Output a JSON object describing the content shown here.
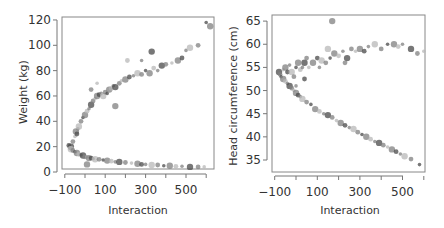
{
  "chart_data": [
    {
      "type": "scatter",
      "title": "",
      "xlabel": "Interaction",
      "ylabel": "Weight (kg)",
      "xlim": [
        -110,
        630
      ],
      "ylim": [
        0,
        120
      ],
      "x_ticks": [
        "-100",
        "100",
        "300",
        "500"
      ],
      "x_minor_ticks": [
        -100,
        0,
        100,
        200,
        300,
        400,
        500,
        600
      ],
      "y_ticks": [
        "0",
        "20",
        "40",
        "60",
        "80",
        "100",
        "120"
      ],
      "grid": false,
      "legend": null,
      "description": "Two branches: upper branch rising from ~(−60,20) to ~(600,118); lower branch decaying from ~(−80,20) to ~(580,4). Points in varying grey shades and sizes.",
      "series": [
        {
          "name": "upper-branch",
          "points": [
            [
              -70,
              20
            ],
            [
              -60,
              24
            ],
            [
              -50,
              28
            ],
            [
              -45,
              32
            ],
            [
              -40,
              30
            ],
            [
              -35,
              34
            ],
            [
              -30,
              36
            ],
            [
              -20,
              40
            ],
            [
              -10,
              43
            ],
            [
              0,
              45
            ],
            [
              10,
              48
            ],
            [
              20,
              50
            ],
            [
              30,
              53
            ],
            [
              40,
              56
            ],
            [
              50,
              58
            ],
            [
              60,
              60
            ],
            [
              70,
              61
            ],
            [
              80,
              62
            ],
            [
              90,
              60
            ],
            [
              100,
              63
            ],
            [
              110,
              62
            ],
            [
              120,
              65
            ],
            [
              130,
              66
            ],
            [
              140,
              68
            ],
            [
              150,
              67
            ],
            [
              170,
              70
            ],
            [
              180,
              72
            ],
            [
              200,
              73
            ],
            [
              220,
              75
            ],
            [
              240,
              76
            ],
            [
              260,
              78
            ],
            [
              280,
              77
            ],
            [
              300,
              80
            ],
            [
              320,
              78
            ],
            [
              340,
              82
            ],
            [
              360,
              80
            ],
            [
              380,
              84
            ],
            [
              400,
              85
            ],
            [
              430,
              86
            ],
            [
              460,
              88
            ],
            [
              480,
              90
            ],
            [
              500,
              96
            ],
            [
              520,
              98
            ],
            [
              560,
              100
            ],
            [
              600,
              118
            ],
            [
              620,
              115
            ],
            [
              210,
              88
            ],
            [
              280,
              88
            ],
            [
              330,
              95
            ],
            [
              30,
              65
            ],
            [
              60,
              70
            ],
            [
              150,
              52
            ]
          ]
        },
        {
          "name": "lower-branch",
          "points": [
            [
              -80,
              21
            ],
            [
              -75,
              19
            ],
            [
              -70,
              18
            ],
            [
              -60,
              17
            ],
            [
              -50,
              16
            ],
            [
              -40,
              15
            ],
            [
              -30,
              14
            ],
            [
              -20,
              13.5
            ],
            [
              -10,
              13
            ],
            [
              0,
              12
            ],
            [
              10,
              12
            ],
            [
              20,
              11
            ],
            [
              30,
              11
            ],
            [
              40,
              10.5
            ],
            [
              50,
              10
            ],
            [
              70,
              10
            ],
            [
              90,
              9.5
            ],
            [
              110,
              9
            ],
            [
              130,
              8.5
            ],
            [
              150,
              8
            ],
            [
              170,
              8
            ],
            [
              200,
              7.5
            ],
            [
              230,
              7
            ],
            [
              260,
              6.5
            ],
            [
              280,
              6
            ],
            [
              300,
              6
            ],
            [
              330,
              5.5
            ],
            [
              360,
              5.5
            ],
            [
              390,
              5
            ],
            [
              420,
              5
            ],
            [
              450,
              4.5
            ],
            [
              480,
              4.5
            ],
            [
              520,
              4
            ],
            [
              560,
              4
            ],
            [
              590,
              4
            ],
            [
              10,
              6
            ]
          ]
        }
      ]
    },
    {
      "type": "scatter",
      "title": "",
      "xlabel": "Interaction",
      "ylabel": "Head circumference (cm)",
      "xlim": [
        -110,
        630
      ],
      "ylim": [
        33,
        66
      ],
      "x_ticks": [
        "-100",
        "100",
        "300",
        "500"
      ],
      "x_minor_ticks": [
        -100,
        0,
        100,
        200,
        300,
        400,
        500,
        600
      ],
      "y_ticks": [
        "35",
        "40",
        "45",
        "50",
        "55",
        "60",
        "65"
      ],
      "grid": false,
      "legend": null,
      "description": "Two branches: upper branch rising from ~(−80,54) to ~(600,59); lower branch falling linearly from ~(−70,53) to ~(590,34). One outlier near (170,65).",
      "series": [
        {
          "name": "upper-branch",
          "points": [
            [
              -80,
              54
            ],
            [
              -75,
              53.5
            ],
            [
              -60,
              54.5
            ],
            [
              -50,
              55
            ],
            [
              -40,
              54
            ],
            [
              -30,
              55.5
            ],
            [
              -20,
              54
            ],
            [
              -10,
              53
            ],
            [
              0,
              55
            ],
            [
              10,
              56
            ],
            [
              20,
              54.5
            ],
            [
              30,
              55
            ],
            [
              40,
              56
            ],
            [
              50,
              57
            ],
            [
              60,
              55
            ],
            [
              80,
              56
            ],
            [
              100,
              57
            ],
            [
              110,
              55
            ],
            [
              120,
              56.5
            ],
            [
              140,
              56
            ],
            [
              160,
              57
            ],
            [
              180,
              58
            ],
            [
              200,
              57.5
            ],
            [
              220,
              58.5
            ],
            [
              240,
              57
            ],
            [
              260,
              59
            ],
            [
              280,
              58.5
            ],
            [
              300,
              59
            ],
            [
              320,
              58.5
            ],
            [
              340,
              59.5
            ],
            [
              370,
              60
            ],
            [
              400,
              59
            ],
            [
              430,
              60
            ],
            [
              460,
              60
            ],
            [
              480,
              59.5
            ],
            [
              500,
              60
            ],
            [
              540,
              59
            ],
            [
              570,
              58
            ],
            [
              600,
              58.5
            ],
            [
              170,
              65
            ],
            [
              40,
              52.5
            ],
            [
              0,
              51
            ],
            [
              150,
              59
            ],
            [
              230,
              56
            ]
          ]
        },
        {
          "name": "lower-branch",
          "points": [
            [
              -70,
              53
            ],
            [
              -60,
              52.5
            ],
            [
              -50,
              52
            ],
            [
              -40,
              51.5
            ],
            [
              -30,
              51
            ],
            [
              -20,
              50.5
            ],
            [
              -10,
              50
            ],
            [
              0,
              49.5
            ],
            [
              10,
              49
            ],
            [
              20,
              48.7
            ],
            [
              30,
              48.2
            ],
            [
              50,
              47.5
            ],
            [
              70,
              47
            ],
            [
              90,
              46
            ],
            [
              110,
              45.5
            ],
            [
              130,
              45
            ],
            [
              150,
              44.7
            ],
            [
              170,
              44.2
            ],
            [
              190,
              43.5
            ],
            [
              210,
              43
            ],
            [
              230,
              42.5
            ],
            [
              250,
              42
            ],
            [
              270,
              41.7
            ],
            [
              290,
              41
            ],
            [
              310,
              40.5
            ],
            [
              330,
              40
            ],
            [
              350,
              39.5
            ],
            [
              370,
              39
            ],
            [
              390,
              38.7
            ],
            [
              410,
              38.2
            ],
            [
              430,
              37.8
            ],
            [
              450,
              37.3
            ],
            [
              470,
              36.8
            ],
            [
              490,
              36.3
            ],
            [
              510,
              35.8
            ],
            [
              540,
              35.2
            ],
            [
              580,
              34
            ]
          ]
        }
      ]
    }
  ],
  "panels": [
    {
      "ylabel": "Weight (kg)",
      "xlabel": "Interaction",
      "y_tick_labels": [
        "0",
        "20",
        "40",
        "60",
        "80",
        "100",
        "120"
      ],
      "x_tick_labels": [
        "-100",
        "100",
        "300",
        "500"
      ]
    },
    {
      "ylabel": "Head circumference (cm)",
      "xlabel": "Interaction",
      "y_tick_labels": [
        "35",
        "40",
        "45",
        "50",
        "55",
        "60",
        "65"
      ],
      "x_tick_labels": [
        "-100",
        "100",
        "300",
        "500"
      ]
    }
  ],
  "colors": {
    "axis": "#777777",
    "text": "#333333",
    "point_dark": "#4a4a4a",
    "point_mid": "#808080",
    "point_light": "#b8b8b8"
  }
}
